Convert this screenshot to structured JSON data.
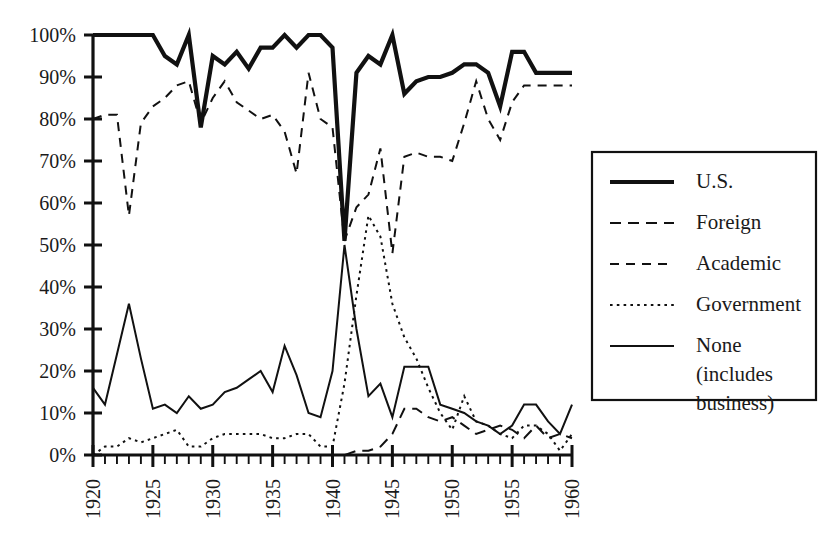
{
  "chart_data": {
    "type": "line",
    "title": "",
    "subtitle": "",
    "xlabel": "",
    "ylabel": "",
    "xlim": [
      1920,
      1960
    ],
    "ylim": [
      0,
      100
    ],
    "grid": false,
    "legend_position": "right",
    "x_tick_labels": [
      "1920",
      "1925",
      "1930",
      "1935",
      "1940",
      "1945",
      "1950",
      "1955",
      "1960"
    ],
    "x_tick_values": [
      1920,
      1925,
      1930,
      1935,
      1940,
      1945,
      1950,
      1955,
      1960
    ],
    "x_minor_tick_step": 1,
    "y_tick_labels": [
      "0%",
      "10%",
      "20%",
      "30%",
      "40%",
      "50%",
      "60%",
      "70%",
      "80%",
      "90%",
      "100%"
    ],
    "y_tick_values": [
      0,
      10,
      20,
      30,
      40,
      50,
      60,
      70,
      80,
      90,
      100
    ],
    "x": [
      1920,
      1921,
      1922,
      1923,
      1924,
      1925,
      1926,
      1927,
      1928,
      1929,
      1930,
      1931,
      1932,
      1933,
      1934,
      1935,
      1936,
      1937,
      1938,
      1939,
      1940,
      1941,
      1942,
      1943,
      1944,
      1945,
      1946,
      1947,
      1948,
      1949,
      1950,
      1951,
      1952,
      1953,
      1954,
      1955,
      1956,
      1957,
      1958,
      1959,
      1960
    ],
    "series": [
      {
        "name": "U.S.",
        "style": "solid-thick",
        "values": [
          100,
          100,
          100,
          100,
          100,
          100,
          95,
          93,
          100,
          78,
          95,
          93,
          96,
          92,
          97,
          97,
          100,
          97,
          100,
          100,
          97,
          51,
          91,
          95,
          93,
          100,
          86,
          89,
          90,
          90,
          91,
          93,
          93,
          91,
          83,
          96,
          96,
          91,
          91,
          91,
          91
        ]
      },
      {
        "name": "Foreign",
        "style": "dash-long",
        "values": [
          0,
          0,
          0,
          0,
          0,
          0,
          0,
          0,
          0,
          0,
          0,
          0,
          0,
          0,
          0,
          0,
          0,
          0,
          0,
          0,
          0,
          0,
          1,
          1,
          2,
          5,
          11,
          11,
          9,
          8,
          9,
          7,
          5,
          6,
          7,
          6,
          4,
          7,
          4,
          5,
          4
        ]
      },
      {
        "name": "Academic",
        "style": "dash-medium",
        "values": [
          80,
          81,
          81,
          57,
          79,
          83,
          85,
          88,
          89,
          79,
          85,
          89,
          84,
          82,
          80,
          81,
          77,
          67,
          91,
          80,
          78,
          51,
          59,
          62,
          73,
          48,
          71,
          72,
          71,
          71,
          70,
          79,
          89,
          80,
          75,
          84,
          88,
          88,
          88,
          88,
          88
        ]
      },
      {
        "name": "Government",
        "style": "dotted",
        "values": [
          0,
          2,
          2,
          4,
          3,
          4,
          5,
          6,
          2,
          2,
          4,
          5,
          5,
          5,
          5,
          4,
          4,
          5,
          5,
          2,
          2,
          17,
          38,
          57,
          52,
          36,
          28,
          23,
          16,
          10,
          6,
          14,
          8,
          7,
          5,
          4,
          7,
          7,
          5,
          1,
          5
        ]
      },
      {
        "name": "None (includes business)",
        "style": "solid-thin",
        "values": [
          16,
          12,
          24,
          36,
          23,
          11,
          12,
          10,
          14,
          11,
          12,
          15,
          16,
          18,
          20,
          15,
          26,
          19,
          10,
          9,
          20,
          50,
          30,
          14,
          17,
          9,
          21,
          21,
          21,
          12,
          11,
          10,
          8,
          7,
          5,
          7,
          12,
          12,
          8,
          5,
          12
        ]
      }
    ]
  },
  "legend": {
    "entries": [
      {
        "label": "U.S.",
        "style": "solid-thick"
      },
      {
        "label": "Foreign",
        "style": "dash-long"
      },
      {
        "label": "Academic",
        "style": "dash-medium"
      },
      {
        "label": "Government",
        "style": "dotted"
      },
      {
        "label": "None",
        "label_line2": "(includes",
        "label_line3": "business)",
        "style": "solid-thin"
      }
    ]
  },
  "colors": {
    "ink": "#111111",
    "background": "#ffffff",
    "text": "#1a1a1a"
  }
}
